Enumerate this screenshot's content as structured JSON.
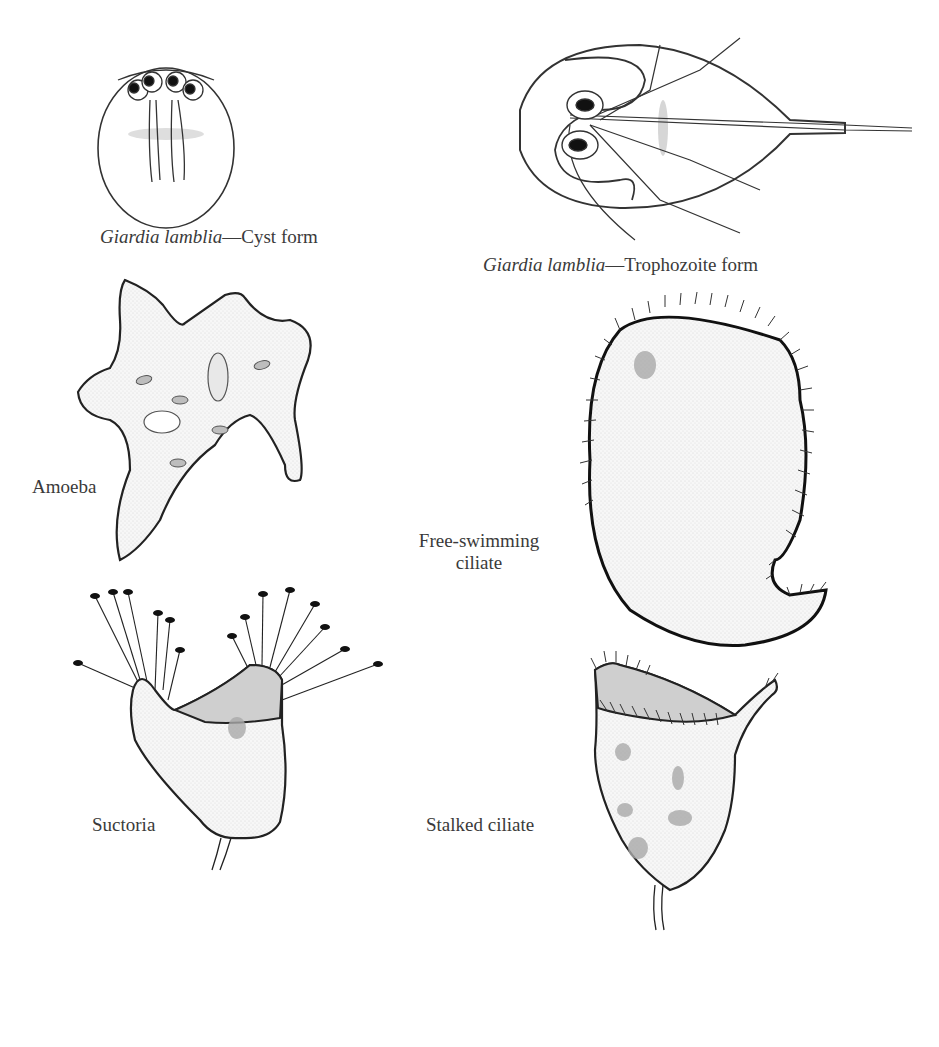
{
  "figure": {
    "panels": [
      {
        "id": "giardia-cyst",
        "label_italic": "Giardia lamblia",
        "label_rest": "—Cyst form"
      },
      {
        "id": "giardia-trophozoite",
        "label_italic": "Giardia lamblia",
        "label_rest": "—Trophozoite form"
      },
      {
        "id": "amoeba",
        "label": "Amoeba"
      },
      {
        "id": "free-swimming-ciliate",
        "label_line1": "Free-swimming",
        "label_line2": "ciliate"
      },
      {
        "id": "suctoria",
        "label": "Suctoria"
      },
      {
        "id": "stalked-ciliate",
        "label": "Stalked ciliate"
      }
    ],
    "colors": {
      "outline": "#222222",
      "fill": "#f2f2f2",
      "organelle": "#c8c8c8",
      "highlight": "#d0d0d0",
      "nucleus": "#aaaaaa"
    }
  }
}
